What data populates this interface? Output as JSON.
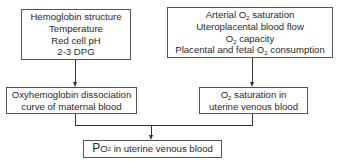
{
  "diagram": {
    "type": "flowchart",
    "nodes": [
      {
        "id": "factors_left",
        "lines": [
          "Hemoglobin structure",
          "Temperature",
          "Red cell pH",
          "2-3 DPG"
        ]
      },
      {
        "id": "factors_right",
        "lines": [
          "Arterial O",
          "saturation",
          "Uteroplacental blood flow",
          "O",
          "capacity",
          "Placental and fetal O",
          "consumption"
        ]
      },
      {
        "id": "curve",
        "lines": [
          "Oxyhemoglobin dissociation",
          "curve of maternal blood"
        ]
      },
      {
        "id": "saturation",
        "lines": [
          "O",
          "saturation in",
          "uterine venous blood"
        ]
      },
      {
        "id": "result",
        "lines": [
          "P",
          "O",
          "in uterine venous blood"
        ]
      }
    ],
    "subscript": "2",
    "edges": [
      {
        "from": "factors_left",
        "to": "curve"
      },
      {
        "from": "factors_right",
        "to": "saturation"
      },
      {
        "from": "curve",
        "to": "result"
      },
      {
        "from": "saturation",
        "to": "result"
      }
    ]
  }
}
